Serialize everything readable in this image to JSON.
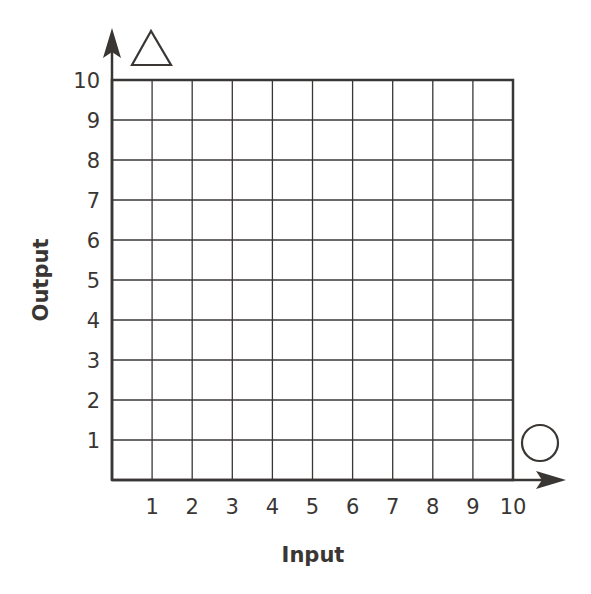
{
  "chart_data": {
    "type": "scatter",
    "title": "",
    "xlabel": "Input",
    "ylabel": "Output",
    "xlim": [
      0,
      10
    ],
    "ylim": [
      0,
      10
    ],
    "grid": true,
    "x_ticks": [
      "1",
      "2",
      "3",
      "4",
      "5",
      "6",
      "7",
      "8",
      "9",
      "10"
    ],
    "y_ticks": [
      "1",
      "2",
      "3",
      "4",
      "5",
      "6",
      "7",
      "8",
      "9",
      "10"
    ],
    "series": [],
    "annotations": [
      {
        "shape": "triangle",
        "position": "top of y-axis",
        "label": "triangle"
      },
      {
        "shape": "circle",
        "position": "right end of x-axis",
        "label": "circle"
      }
    ]
  },
  "axes": {
    "x_title": "Input",
    "y_title": "Output"
  },
  "colors": {
    "ink": "#3a3634",
    "background": "#ffffff"
  }
}
